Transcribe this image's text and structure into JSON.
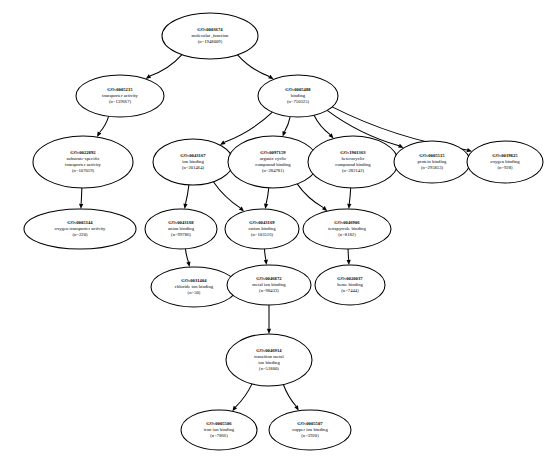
{
  "diagram": {
    "type": "directed-acyclic-graph",
    "node_shape": "ellipse",
    "background_color": "#ffffff",
    "line_color": "#000000"
  },
  "nodes": [
    {
      "id": "GO0003674",
      "go_id": "GO:0003674",
      "label": "molecular_function",
      "count_label": "(n=1948009)",
      "count": 1948009,
      "lines": [
        "GO:0003674",
        "molecular_function",
        "(n=1948009)"
      ],
      "cx": 210,
      "cy": 36,
      "rx": 48,
      "ry": 23
    },
    {
      "id": "GO0005215",
      "go_id": "GO:0005215",
      "label": "transporter activity",
      "count_label": "(n=139667)",
      "count": 139667,
      "lines": [
        "GO:0005215",
        "transporter activity",
        "(n=139667)"
      ],
      "cx": 120,
      "cy": 96,
      "rx": 44,
      "ry": 21
    },
    {
      "id": "GO0005488",
      "go_id": "GO:0005488",
      "label": "binding",
      "count_label": "(n=750325)",
      "count": 750325,
      "lines": [
        "GO:0005488",
        "binding",
        "(n=750325)"
      ],
      "cx": 298,
      "cy": 96,
      "rx": 40,
      "ry": 21
    },
    {
      "id": "GO0022892",
      "go_id": "GO:0022892",
      "label": "substrate-specific transporter activity",
      "count_label": "(n=107019)",
      "count": 107019,
      "lines": [
        "GO:0022892",
        "substrate-specific",
        "transporter activity",
        "(n=107019)"
      ],
      "cx": 83,
      "cy": 162,
      "rx": 50,
      "ry": 26
    },
    {
      "id": "GO0043167",
      "go_id": "GO:0043167",
      "label": "ion binding",
      "count_label": "(n=201464)",
      "count": 201464,
      "lines": [
        "GO:0043167",
        "ion binding",
        "(n=201464)"
      ],
      "cx": 193,
      "cy": 162,
      "rx": 40,
      "ry": 23
    },
    {
      "id": "GO0097159",
      "go_id": "GO:0097159",
      "label": "organic cyclic compound binding",
      "count_label": "(n=284781)",
      "count": 284781,
      "lines": [
        "GO:0097159",
        "organic cyclic",
        "compound binding",
        "(n=284781)"
      ],
      "cx": 273,
      "cy": 162,
      "rx": 45,
      "ry": 26
    },
    {
      "id": "GO1901363",
      "go_id": "GO:1901363",
      "label": "heterocyclic compound binding",
      "count_label": "(n=282142)",
      "count": 282142,
      "lines": [
        "GO:1901363",
        "heterocyclic",
        "compound binding",
        "(n=282142)"
      ],
      "cx": 353,
      "cy": 162,
      "rx": 45,
      "ry": 26
    },
    {
      "id": "GO0005515",
      "go_id": "GO:0005515",
      "label": "protein binding",
      "count_label": "(n=295853)",
      "count": 295853,
      "lines": [
        "GO:0005515",
        "protein binding",
        "(n=295853)"
      ],
      "cx": 432,
      "cy": 162,
      "rx": 38,
      "ry": 21
    },
    {
      "id": "GO0019825",
      "go_id": "GO:0019825",
      "label": "oxygen binding",
      "count_label": "(n=928)",
      "count": 928,
      "lines": [
        "GO:0019825",
        "oxygen binding",
        "(n=928)"
      ],
      "cx": 505,
      "cy": 162,
      "rx": 38,
      "ry": 21
    },
    {
      "id": "GO0005344",
      "go_id": "GO:0005344",
      "label": "oxygen transporter activity",
      "count_label": "(n=220)",
      "count": 220,
      "lines": [
        "GO:0005344",
        "oxygen transporter activity",
        "(n=220)"
      ],
      "cx": 80,
      "cy": 229,
      "rx": 56,
      "ry": 20
    },
    {
      "id": "GO0043168",
      "go_id": "GO:0043168",
      "label": "anion binding",
      "count_label": "(n=99786)",
      "count": 99786,
      "lines": [
        "GO:0043168",
        "anion binding",
        "(n=99786)"
      ],
      "cx": 181,
      "cy": 229,
      "rx": 36,
      "ry": 20
    },
    {
      "id": "GO0043169",
      "go_id": "GO:0043169",
      "label": "cation binding",
      "count_label": "(n=103516)",
      "count": 103516,
      "lines": [
        "GO:0043169",
        "cation binding",
        "(n=103516)"
      ],
      "cx": 262,
      "cy": 229,
      "rx": 37,
      "ry": 20
    },
    {
      "id": "GO0046906",
      "go_id": "GO:0046906",
      "label": "tetrapyrrole binding",
      "count_label": "(n=8182)",
      "count": 8182,
      "lines": [
        "GO:0046906",
        "tetrapyrrole binding",
        "(n=8182)"
      ],
      "cx": 347,
      "cy": 229,
      "rx": 44,
      "ry": 20
    },
    {
      "id": "GO0031404",
      "go_id": "GO:0031404",
      "label": "chloride ion binding",
      "count_label": "(n=50)",
      "count": 50,
      "lines": [
        "GO:0031404",
        "chloride ion binding",
        "(n=50)"
      ],
      "cx": 194,
      "cy": 287,
      "rx": 43,
      "ry": 20
    },
    {
      "id": "GO0046872",
      "go_id": "GO:0046872",
      "label": "metal ion binding",
      "count_label": "(n=98433)",
      "count": 98433,
      "lines": [
        "GO:0046872",
        "metal ion binding",
        "(n=98433)"
      ],
      "cx": 269,
      "cy": 285,
      "rx": 42,
      "ry": 20
    },
    {
      "id": "GO0020037",
      "go_id": "GO:0020037",
      "label": "heme binding",
      "count_label": "(n=7444)",
      "count": 7444,
      "lines": [
        "GO:0020037",
        "heme binding",
        "(n=7444)"
      ],
      "cx": 350,
      "cy": 285,
      "rx": 35,
      "ry": 20
    },
    {
      "id": "GO0046914",
      "go_id": "GO:0046914",
      "label": "transition metal ion binding",
      "count_label": "(n=51800)",
      "count": 51800,
      "lines": [
        "GO:0046914",
        "transition metal",
        "ion binding",
        "(n=51800)"
      ],
      "cx": 269,
      "cy": 360,
      "rx": 43,
      "ry": 26
    },
    {
      "id": "GO0005506",
      "go_id": "GO:0005506",
      "label": "iron ion binding",
      "count_label": "(n=7866)",
      "count": 7866,
      "lines": [
        "GO:0005506",
        "iron ion binding",
        "(n=7866)"
      ],
      "cx": 219,
      "cy": 430,
      "rx": 38,
      "ry": 20
    },
    {
      "id": "GO0005507",
      "go_id": "GO:0005507",
      "label": "copper ion binding",
      "count_label": "(n=3920)",
      "count": 3920,
      "lines": [
        "GO:0005507",
        "copper ion binding",
        "(n=3920)"
      ],
      "cx": 310,
      "cy": 430,
      "rx": 41,
      "ry": 20
    }
  ],
  "edges": [
    {
      "from": "GO0003674",
      "to": "GO0005215"
    },
    {
      "from": "GO0003674",
      "to": "GO0005488"
    },
    {
      "from": "GO0005215",
      "to": "GO0022892"
    },
    {
      "from": "GO0005488",
      "to": "GO0043167"
    },
    {
      "from": "GO0005488",
      "to": "GO0097159"
    },
    {
      "from": "GO0005488",
      "to": "GO1901363"
    },
    {
      "from": "GO0005488",
      "to": "GO0005515"
    },
    {
      "from": "GO0005488",
      "to": "GO0019825"
    },
    {
      "from": "GO0022892",
      "to": "GO0005344"
    },
    {
      "from": "GO0043167",
      "to": "GO0043168"
    },
    {
      "from": "GO0043167",
      "to": "GO0043169"
    },
    {
      "from": "GO0097159",
      "to": "GO0043169"
    },
    {
      "from": "GO0097159",
      "to": "GO0046906"
    },
    {
      "from": "GO1901363",
      "to": "GO0046906"
    },
    {
      "from": "GO0043168",
      "to": "GO0031404"
    },
    {
      "from": "GO0043169",
      "to": "GO0046872"
    },
    {
      "from": "GO0046906",
      "to": "GO0020037"
    },
    {
      "from": "GO0046872",
      "to": "GO0046914"
    },
    {
      "from": "GO0046914",
      "to": "GO0005506"
    },
    {
      "from": "GO0046914",
      "to": "GO0005507"
    }
  ]
}
